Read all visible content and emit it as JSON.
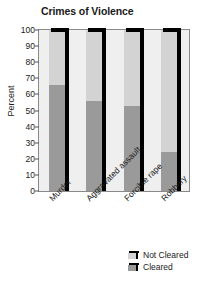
{
  "chart_data": {
    "type": "bar",
    "title": "Crimes of Violence",
    "xlabel": "",
    "ylabel": "Percent",
    "ylim": [
      0,
      100
    ],
    "yticks": [
      0,
      10,
      20,
      30,
      40,
      50,
      60,
      70,
      80,
      90,
      100
    ],
    "grid": false,
    "stacked": true,
    "legend_position": "bottom-right",
    "categories": [
      "Murder",
      "Aggravated assault",
      "Forcible rape",
      "Robbery"
    ],
    "series": [
      {
        "name": "Not Cleared",
        "color": "#d3d3d3",
        "values": [
          34,
          44,
          47,
          76
        ]
      },
      {
        "name": "Cleared",
        "color": "#9a9a9a",
        "values": [
          66,
          56,
          53,
          24
        ]
      }
    ]
  },
  "legend": {
    "items": [
      {
        "label": "Not Cleared",
        "color": "#d3d3d3"
      },
      {
        "label": "Cleared",
        "color": "#9a9a9a"
      }
    ]
  },
  "colors": {
    "not_cleared": "#d3d3d3",
    "cleared": "#9a9a9a",
    "plot_background": "#efefef",
    "bar_shadow": "#000000",
    "text": "#1a1a1a"
  }
}
